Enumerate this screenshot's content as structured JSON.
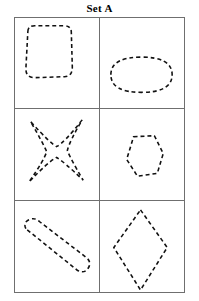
{
  "page": {
    "title": "Set A",
    "background_color": "#ffffff",
    "grid_line_color": "#6f6f6f",
    "shape_stroke_color": "#111111",
    "shape_style": "dashed-outline",
    "shape_fill": "none"
  },
  "grid": {
    "rows": 3,
    "columns": 2,
    "cells": [
      {
        "position": "row-1-col-1",
        "shape_name": "rounded-square",
        "label": "rounded square",
        "dash_pattern": "4 3",
        "path": "M 13 14 Q 13 8 20 8 L 50 8 Q 57 8 57 15 L 58 50 Q 58 60 50 60 L 20 61 Q 11 61 11 52 Z"
      },
      {
        "position": "row-1-col-2",
        "shape_name": "ellipse",
        "label": "horizontal ellipse",
        "dash_pattern": "4 3",
        "path": "M 11 58 Q 11 40 42 40 Q 73 40 73 58 Q 73 76 42 76 Q 11 76 11 58 Z"
      },
      {
        "position": "row-2-col-1",
        "shape_name": "four-pointed-star",
        "label": "four pointed star",
        "dash_pattern": "4 3",
        "path": "M 16 13 Q 36 35 42 38 Q 50 34 68 11 Q 55 33 53 42 Q 56 50 69 72 Q 48 52 42 49 Q 34 53 14 74 Q 30 51 32 43 Q 28 34 16 13 Z"
      },
      {
        "position": "row-2-col-2",
        "shape_name": "hexagon",
        "label": "hexagon",
        "dash_pattern": "4 3",
        "path": "M 34 28 L 55 27 L 64 45 L 58 65 L 38 68 L 27 51 Z"
      },
      {
        "position": "row-3-col-1",
        "shape_name": "rotated-rounded-rectangle",
        "label": "tilted rounded rectangle",
        "dash_pattern": "4 3",
        "path": "M 11 28 Q 8 22 14 19 Q 20 16 25 21 L 72 57 Q 78 62 74 68 Q 70 74 63 70 Z"
      },
      {
        "position": "row-3-col-2",
        "shape_name": "diamond",
        "label": "vertical diamond",
        "dash_pattern": "4 3",
        "path": "M 41 9 L 68 47 L 41 90 L 14 47 Z"
      }
    ]
  }
}
